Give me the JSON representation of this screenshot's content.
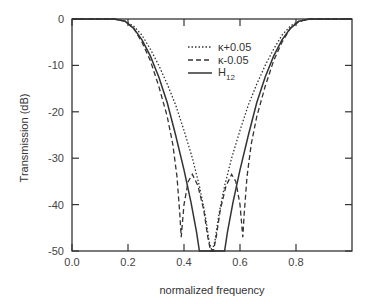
{
  "chart_data": {
    "type": "line",
    "title": "",
    "xlabel": "normalized frequency",
    "ylabel": "Transmission (dB)",
    "xlim": [
      0.0,
      1.0
    ],
    "ylim": [
      -50,
      0
    ],
    "xticks": [
      "0.0",
      "0.2",
      "0.4",
      "0.6",
      "0.8"
    ],
    "xtick_values": [
      0.0,
      0.2,
      0.4,
      0.6,
      0.8
    ],
    "yticks": [
      "0",
      "-10",
      "-20",
      "-30",
      "-40",
      "-50"
    ],
    "ytick_values": [
      0,
      -10,
      -20,
      -30,
      -40,
      -50
    ],
    "grid": false,
    "legend_position": "upper center",
    "series": [
      {
        "name": "κ+0.05",
        "style": "dotted",
        "x": [
          0.0,
          0.15,
          0.19,
          0.22,
          0.25,
          0.28,
          0.31,
          0.34,
          0.37,
          0.4,
          0.43,
          0.455,
          0.475,
          0.49,
          0.5,
          0.51,
          0.525,
          0.545,
          0.57,
          0.6,
          0.63,
          0.66,
          0.69,
          0.72,
          0.75,
          0.78,
          0.81,
          0.85,
          1.0
        ],
        "y": [
          0,
          0,
          -0.5,
          -1.5,
          -3.5,
          -6.5,
          -10,
          -14,
          -18.5,
          -24,
          -30,
          -36,
          -42,
          -48,
          -50,
          -48,
          -42,
          -36,
          -30,
          -24,
          -18.5,
          -14,
          -10,
          -6.5,
          -3.5,
          -1.5,
          -0.5,
          0,
          0
        ]
      },
      {
        "name": "κ-0.05",
        "style": "dashed",
        "x": [
          0.0,
          0.15,
          0.19,
          0.22,
          0.25,
          0.28,
          0.31,
          0.34,
          0.36,
          0.375,
          0.385,
          0.39,
          0.4,
          0.415,
          0.43,
          0.45,
          0.47,
          0.485,
          0.495,
          0.5,
          0.505,
          0.515,
          0.53,
          0.55,
          0.57,
          0.585,
          0.6,
          0.61,
          0.615,
          0.625,
          0.64,
          0.66,
          0.69,
          0.72,
          0.75,
          0.78,
          0.81,
          0.85,
          1.0
        ],
        "y": [
          0,
          0,
          -0.5,
          -2,
          -5,
          -9,
          -14.5,
          -21,
          -27,
          -34,
          -42,
          -47,
          -40,
          -35,
          -33.5,
          -36,
          -41,
          -47,
          -50,
          -50,
          -50,
          -47,
          -41,
          -36,
          -33.5,
          -35,
          -40,
          -47,
          -42,
          -34,
          -27,
          -21,
          -14.5,
          -9,
          -5,
          -2,
          -0.5,
          0,
          0
        ]
      },
      {
        "name": "H12",
        "style": "solid",
        "x": [
          0.0,
          0.15,
          0.19,
          0.22,
          0.25,
          0.28,
          0.31,
          0.34,
          0.37,
          0.4,
          0.425,
          0.445,
          0.455,
          0.545,
          0.555,
          0.575,
          0.6,
          0.63,
          0.66,
          0.69,
          0.72,
          0.75,
          0.78,
          0.81,
          0.85,
          1.0
        ],
        "y": [
          0,
          0,
          -0.5,
          -2,
          -4.5,
          -8,
          -12.5,
          -18,
          -25,
          -32.5,
          -39.5,
          -46,
          -50,
          -50,
          -46,
          -39.5,
          -32.5,
          -25,
          -18,
          -12.5,
          -8,
          -4.5,
          -2,
          -0.5,
          0,
          0
        ]
      }
    ]
  },
  "legend": [
    {
      "label": "κ+0.05",
      "style": "dotted"
    },
    {
      "label": "κ-0.05",
      "style": "dashed"
    },
    {
      "label_main": "H",
      "label_sub": "12",
      "style": "solid"
    }
  ]
}
